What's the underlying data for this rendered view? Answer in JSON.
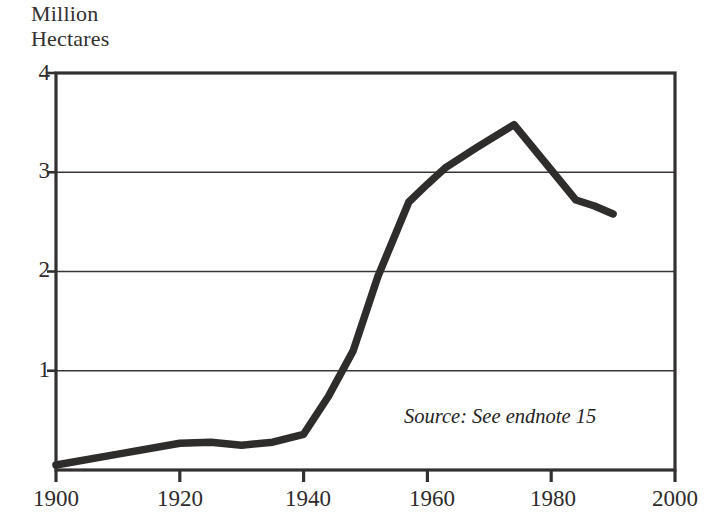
{
  "figure": {
    "y_axis_title_line1": "Million",
    "y_axis_title_line2": "Hectares",
    "source_note": "Source: See endnote 15",
    "frame_color": "#333030",
    "grid_color": "#3a3636",
    "line_color": "#2f2c2c",
    "background_color": "#ffffff"
  },
  "chart_data": {
    "type": "line",
    "title": "",
    "subtitle": "",
    "xlabel": "",
    "ylabel": "Million Hectares",
    "xlim": [
      1900,
      2000
    ],
    "ylim": [
      0,
      4
    ],
    "xticks": [
      1900,
      1920,
      1940,
      1960,
      1980,
      2000
    ],
    "xtick_labels": [
      "1900",
      "1920",
      "1940",
      "1960",
      "1980",
      "2000"
    ],
    "yticks": [
      1,
      2,
      3,
      4
    ],
    "ytick_labels": [
      "1",
      "2",
      "3",
      "4"
    ],
    "grid": "horizontal",
    "legend": "none",
    "annotations": [
      {
        "text": "Source: See endnote 15",
        "x": 1965,
        "y": 0.62,
        "style": "italic"
      }
    ],
    "series": [
      {
        "name": "Area",
        "x": [
          1900,
          1910,
          1920,
          1925,
          1930,
          1935,
          1940,
          1944,
          1948,
          1952,
          1957,
          1960,
          1963,
          1968,
          1974,
          1979,
          1984,
          1987,
          1990
        ],
        "values": [
          0.05,
          0.16,
          0.27,
          0.28,
          0.25,
          0.28,
          0.36,
          0.74,
          1.2,
          1.95,
          2.7,
          2.88,
          3.05,
          3.25,
          3.48,
          3.1,
          2.72,
          2.66,
          2.58
        ]
      }
    ]
  }
}
